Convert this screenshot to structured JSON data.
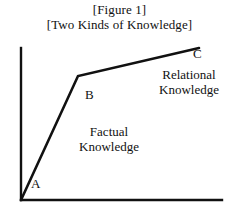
{
  "figure": {
    "title_line_1": "[Figure 1]",
    "title_line_2": "[Two Kinds of Knowledge]"
  },
  "labels": {
    "point_a": "A",
    "point_b": "B",
    "point_c": "C",
    "factual_line_1": "Factual",
    "factual_line_2": "Knowledge",
    "relational_line_1": "Relational",
    "relational_line_2": "Knowledge"
  },
  "colors": {
    "background": "#ffffff",
    "ink": "#111111",
    "axis": "#111111",
    "curve": "#111111"
  },
  "chart_data": {
    "type": "line",
    "title": "[Two Kinds of Knowledge]",
    "xlabel": "",
    "ylabel": "",
    "grid": false,
    "legend": "none",
    "axes": {
      "y_axis": {
        "x": 21,
        "y_top": 48,
        "y_bottom": 200
      },
      "x_axis": {
        "y": 200,
        "x_left": 21,
        "x_right": 222
      },
      "arrowheads": false
    },
    "series": [
      {
        "name": "knowledge-growth",
        "points": [
          {
            "label": "origin",
            "x": 21,
            "y": 200
          },
          {
            "label": "B",
            "x": 78,
            "y": 76
          },
          {
            "label": "C",
            "x": 199,
            "y": 48
          }
        ],
        "segments": [
          {
            "name": "factual-segment",
            "from": "origin",
            "to": "B",
            "annotation": "Factual Knowledge"
          },
          {
            "name": "relational-segment",
            "from": "B",
            "to": "C",
            "annotation": "Relational Knowledge"
          }
        ]
      }
    ],
    "annotations": [
      {
        "text": "A",
        "x": 31,
        "y": 177
      },
      {
        "text": "B",
        "x": 85,
        "y": 88
      },
      {
        "text": "C",
        "x": 193,
        "y": 47
      },
      {
        "text": "Factual Knowledge",
        "x": 66,
        "y": 124
      },
      {
        "text": "Relational Knowledge",
        "x": 142,
        "y": 67
      }
    ]
  }
}
